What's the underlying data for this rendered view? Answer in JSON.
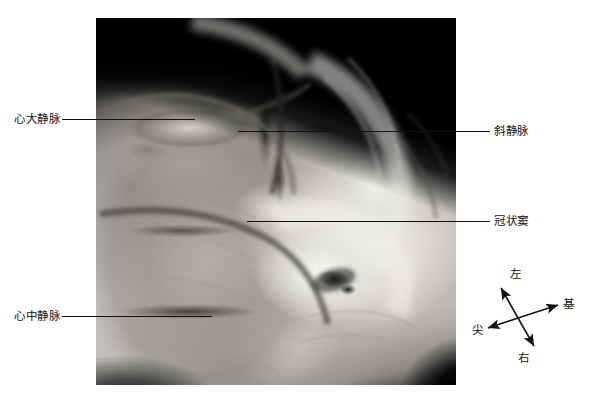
{
  "figure": {
    "type": "anatomical-specimen-photograph",
    "rendering": "grayscale halftone photograph",
    "frame": {
      "x": 96,
      "y": 18,
      "width": 360,
      "height": 367
    }
  },
  "labels": [
    {
      "id": "great-cardiac-vein",
      "text": "心大静脉",
      "side": "left",
      "text_x": 14,
      "text_y": 112,
      "leader": {
        "x": 62,
        "y": 119,
        "length": 133
      }
    },
    {
      "id": "middle-cardiac-vein",
      "text": "心中静脉",
      "side": "left",
      "text_x": 14,
      "text_y": 309,
      "leader": {
        "x": 62,
        "y": 316,
        "length": 150
      }
    },
    {
      "id": "oblique-vein",
      "text": "斜静脉",
      "side": "right",
      "text_x": 494,
      "text_y": 124,
      "leader": {
        "x": 238,
        "y": 131,
        "length": 252
      }
    },
    {
      "id": "coronary-sinus",
      "text": "冠状窦",
      "side": "right",
      "text_x": 494,
      "text_y": 214,
      "leader": {
        "x": 247,
        "y": 221,
        "length": 243
      }
    }
  ],
  "compass": {
    "name": "orientation-indicator",
    "directions": [
      {
        "id": "left",
        "text": "左",
        "position": "top",
        "label_x": 42,
        "label_y": 2
      },
      {
        "id": "base",
        "text": "基",
        "position": "right",
        "label_x": 95,
        "label_y": 32
      },
      {
        "id": "apex",
        "text": "尖",
        "position": "left",
        "label_x": 4,
        "label_y": 58
      },
      {
        "id": "right",
        "text": "右",
        "position": "bottom",
        "label_x": 50,
        "label_y": 86
      }
    ],
    "axes": [
      {
        "id": "left-right-axis",
        "from": [
          33,
          22
        ],
        "to": [
          66,
          80
        ]
      },
      {
        "id": "apex-base-axis",
        "from": [
          20,
          62
        ],
        "to": [
          92,
          38
        ]
      }
    ]
  },
  "colors": {
    "page_background": "#ffffff",
    "text": "#141414",
    "leader_line": "#111111",
    "photo_dark": "#000000",
    "photo_light": "#f5f3f0"
  }
}
